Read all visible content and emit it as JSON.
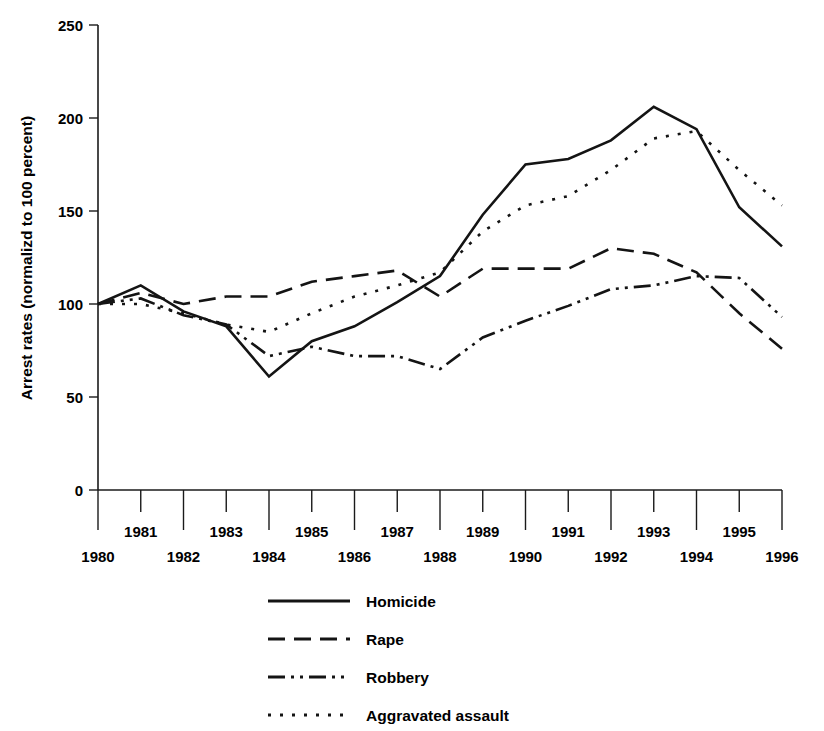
{
  "chart_data": {
    "type": "line",
    "title": "",
    "xlabel": "",
    "ylabel": "Arrest rates (normalizd to 100 percent)",
    "x": [
      1980,
      1981,
      1982,
      1983,
      1984,
      1985,
      1986,
      1987,
      1988,
      1989,
      1990,
      1991,
      1992,
      1993,
      1994,
      1995,
      1996
    ],
    "xtick_labels": [
      "1980",
      "1981",
      "1982",
      "1983",
      "1984",
      "1985",
      "1986",
      "1987",
      "1988",
      "1989",
      "1990",
      "1991",
      "1992",
      "1993",
      "1994",
      "1995",
      "1996"
    ],
    "ytick_labels": [
      "0",
      "50",
      "100",
      "150",
      "200",
      "250"
    ],
    "ytick_values": [
      0,
      50,
      100,
      150,
      200,
      250
    ],
    "xlim": [
      1980,
      1996
    ],
    "ylim": [
      0,
      250
    ],
    "grid": false,
    "legend_position": "bottom-center",
    "series": [
      {
        "name": "Homicide",
        "style": "solid",
        "values": [
          100,
          110,
          96,
          88,
          61,
          80,
          88,
          101,
          115,
          148,
          175,
          178,
          188,
          206,
          194,
          152,
          131
        ]
      },
      {
        "name": "Rape",
        "style": "dashed",
        "values": [
          100,
          106,
          100,
          104,
          104,
          112,
          115,
          118,
          104,
          119,
          119,
          119,
          130,
          127,
          117,
          95,
          76
        ]
      },
      {
        "name": "Robbery",
        "style": "dash-dot-dot",
        "values": [
          100,
          103,
          94,
          89,
          72,
          77,
          72,
          72,
          65,
          82,
          91,
          99,
          108,
          110,
          115,
          114,
          93
        ]
      },
      {
        "name": "Aggravated assault",
        "style": "dotted",
        "values": [
          100,
          100,
          95,
          89,
          85,
          95,
          104,
          110,
          117,
          139,
          153,
          158,
          172,
          189,
          193,
          172,
          153
        ]
      }
    ]
  },
  "legend": {
    "items": [
      {
        "label": "Homicide",
        "style": "solid"
      },
      {
        "label": "Rape",
        "style": "dashed"
      },
      {
        "label": "Robbery",
        "style": "dash-dot-dot"
      },
      {
        "label": "Aggravated assault",
        "style": "dotted"
      }
    ]
  },
  "colors": {
    "ink": "#141414",
    "background": "#ffffff"
  }
}
